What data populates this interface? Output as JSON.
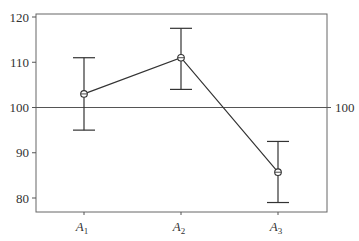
{
  "chart_data": {
    "type": "line",
    "title": "",
    "xlabel": "",
    "ylabel": "",
    "categories": [
      "A1",
      "A2",
      "A3"
    ],
    "category_labels": [
      {
        "main": "A",
        "sub": "1"
      },
      {
        "main": "A",
        "sub": "2"
      },
      {
        "main": "A",
        "sub": "3"
      }
    ],
    "series": [
      {
        "name": "mean",
        "values": [
          103,
          111,
          85.7
        ],
        "error_upper": [
          111,
          117.5,
          92.5
        ],
        "error_lower": [
          95,
          104,
          79
        ]
      }
    ],
    "reference_line": {
      "value": 100,
      "label": "100"
    },
    "ylim": [
      77,
      121
    ],
    "yticks": [
      80,
      90,
      100,
      110,
      120
    ],
    "ytick_labels": [
      "80",
      "90",
      "100",
      "110",
      "120"
    ],
    "grid": false,
    "legend": null,
    "colors": {
      "line": "#333333",
      "frame": "#666666",
      "background": "#ffffff"
    }
  }
}
